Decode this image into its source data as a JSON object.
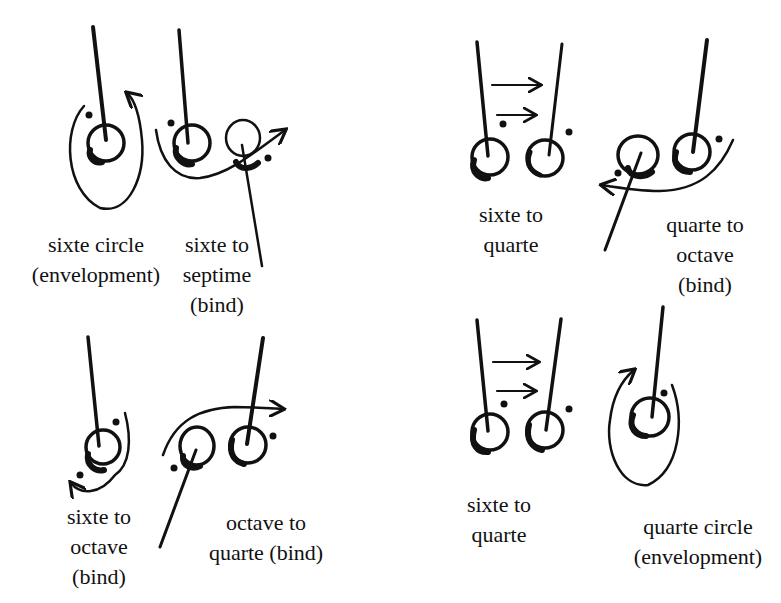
{
  "colors": {
    "ink": "#111111",
    "background": "#ffffff"
  },
  "diagrams": [
    {
      "id": "sixte-circle",
      "label_lines": [
        "sixte circle",
        "(envelopment)"
      ]
    },
    {
      "id": "sixte-to-septime",
      "label_lines": [
        "sixte to",
        "septime",
        "(bind)"
      ]
    },
    {
      "id": "sixte-to-quarte-top",
      "label_lines": [
        "sixte to",
        "quarte"
      ]
    },
    {
      "id": "quarte-to-octave",
      "label_lines": [
        "quarte to",
        "octave",
        "(bind)"
      ]
    },
    {
      "id": "sixte-to-octave",
      "label_lines": [
        "sixte to",
        "octave",
        "(bind)"
      ]
    },
    {
      "id": "octave-to-quarte",
      "label_lines": [
        "octave to",
        "quarte (bind)"
      ]
    },
    {
      "id": "sixte-to-quarte-bottom",
      "label_lines": [
        "sixte to",
        "quarte"
      ]
    },
    {
      "id": "quarte-circle",
      "label_lines": [
        "quarte circle",
        "(envelopment)"
      ]
    }
  ]
}
